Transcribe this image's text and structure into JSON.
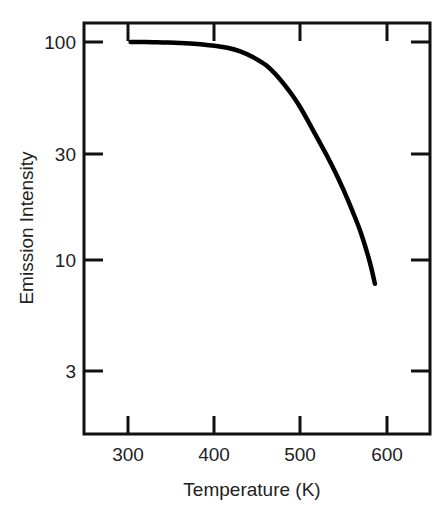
{
  "chart_data": {
    "type": "line",
    "title": "",
    "subtitle": "",
    "xlabel": "Temperature (K)",
    "ylabel": "Emission Intensity",
    "xscale": "linear",
    "yscale": "log",
    "xlim": [
      250,
      650
    ],
    "ylim": [
      2.0,
      130
    ],
    "grid": false,
    "legend": null,
    "xticks": [
      300,
      400,
      500,
      600
    ],
    "xticklabels": [
      "300",
      "400",
      "500",
      "600"
    ],
    "yticks": [
      100,
      30,
      10,
      3
    ],
    "yticklabels": [
      "100",
      "30",
      "10",
      "3"
    ],
    "series": [
      {
        "name": "Emission intensity vs temperature",
        "color": "#000000",
        "linewidth": 4.5,
        "x": [
          303,
          320,
          340,
          360,
          380,
          400,
          415,
          430,
          445,
          460,
          475,
          490,
          500,
          510,
          520,
          530,
          540,
          550,
          560,
          570,
          580,
          586
        ],
        "y": [
          100,
          100,
          99.5,
          99,
          98,
          96,
          94,
          90.5,
          85,
          78,
          68,
          57,
          49.5,
          42,
          35.5,
          30,
          25,
          20.5,
          16.5,
          13,
          9.6,
          7.6
        ]
      }
    ],
    "annotations": []
  },
  "axes": {
    "frame_color": "#111111",
    "tick_color": "#111111",
    "background": "#ffffff"
  },
  "labels": {
    "x_axis_title": "Temperature (K)",
    "y_axis_title": "Emission Intensity"
  }
}
